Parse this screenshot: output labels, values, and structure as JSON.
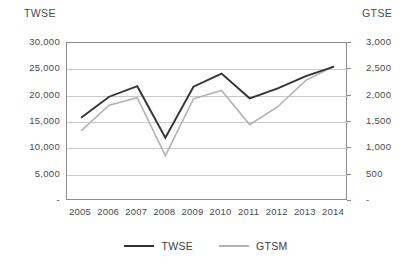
{
  "chart_data": {
    "type": "line",
    "title": "",
    "xlabel": "",
    "ylabel": "TWSE",
    "y2label": "GTSE",
    "grid": true,
    "legend_position": "bottom-center",
    "categories": [
      "2005",
      "2006",
      "2007",
      "2008",
      "2009",
      "2010",
      "2011",
      "2012",
      "2013",
      "2014"
    ],
    "ylim": [
      0,
      30000
    ],
    "y2lim": [
      0,
      3000
    ],
    "yticks": [
      "-",
      "5,000",
      "10,000",
      "15,000",
      "20,000",
      "25,000",
      "30,000"
    ],
    "y2ticks": [
      "-",
      "500",
      "1,000",
      "1,500",
      "2,000",
      "2,500",
      "3,000"
    ],
    "ytick_values": [
      0,
      5000,
      10000,
      15000,
      20000,
      25000,
      30000
    ],
    "y2tick_values": [
      0,
      500,
      1000,
      1500,
      2000,
      2500,
      3000
    ],
    "series": [
      {
        "name": "TWSE",
        "axis": "left",
        "color": "#333333",
        "values": [
          15800,
          19800,
          21800,
          12000,
          21700,
          24200,
          19500,
          21400,
          23700,
          25500
        ]
      },
      {
        "name": "GTSM",
        "axis": "right",
        "color": "#b3b3b3",
        "values": [
          1330,
          1820,
          1960,
          860,
          1940,
          2100,
          1450,
          1790,
          2290,
          2560
        ]
      }
    ]
  },
  "axes": {
    "left_title": "TWSE",
    "right_title": "GTSE"
  },
  "legend": {
    "items": [
      {
        "label": "TWSE",
        "color": "#333333"
      },
      {
        "label": "GTSM",
        "color": "#b3b3b3"
      }
    ]
  },
  "colors": {
    "twse_line": "#333333",
    "gtsm_line": "#b3b3b3",
    "gridline": "#c9c9c9",
    "frame": "#8c8c8c",
    "text": "#404040"
  }
}
